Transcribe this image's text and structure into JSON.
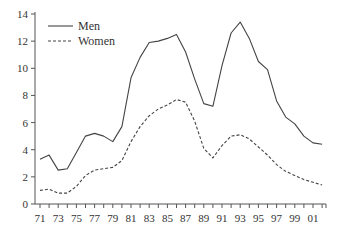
{
  "chart_data": {
    "type": "line",
    "title": "",
    "xlabel": "",
    "ylabel": "",
    "x": [
      "71",
      "72",
      "73",
      "74",
      "75",
      "76",
      "77",
      "78",
      "79",
      "80",
      "81",
      "82",
      "83",
      "84",
      "85",
      "86",
      "87",
      "88",
      "89",
      "90",
      "91",
      "92",
      "93",
      "94",
      "95",
      "96",
      "97",
      "98",
      "99",
      "00",
      "01",
      "02"
    ],
    "x_tick_labels": [
      "71",
      "73",
      "75",
      "77",
      "79",
      "81",
      "83",
      "85",
      "87",
      "89",
      "91",
      "93",
      "95",
      "97",
      "99",
      "01"
    ],
    "y_ticks": [
      0,
      2,
      4,
      6,
      8,
      10,
      12,
      14
    ],
    "ylim": [
      0,
      14
    ],
    "grid": false,
    "legend_position": "upper-left",
    "series": [
      {
        "name": "Men",
        "style": "solid",
        "values": [
          3.3,
          3.6,
          2.5,
          2.6,
          3.8,
          5.0,
          5.2,
          5.0,
          4.6,
          5.7,
          9.3,
          10.8,
          11.9,
          12.0,
          12.2,
          12.5,
          11.2,
          9.2,
          7.4,
          7.2,
          10.2,
          12.6,
          13.4,
          12.2,
          10.5,
          9.9,
          7.6,
          6.4,
          5.9,
          5.0,
          4.5,
          4.4
        ]
      },
      {
        "name": "Women",
        "style": "dashed",
        "values": [
          1.0,
          1.1,
          0.8,
          0.8,
          1.3,
          2.1,
          2.5,
          2.6,
          2.7,
          3.2,
          4.6,
          5.7,
          6.5,
          7.0,
          7.3,
          7.7,
          7.5,
          6.1,
          4.1,
          3.4,
          4.3,
          5.0,
          5.1,
          4.8,
          4.2,
          3.6,
          2.9,
          2.4,
          2.1,
          1.8,
          1.6,
          1.4
        ]
      }
    ]
  },
  "colors": {
    "line": "#444444",
    "axis": "#555555",
    "text": "#333333"
  }
}
